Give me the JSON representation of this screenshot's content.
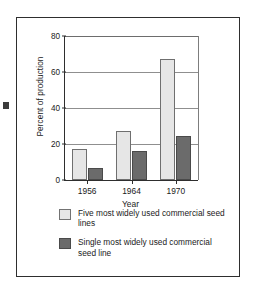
{
  "chart_data": {
    "type": "bar",
    "title": "",
    "xlabel": "Year",
    "ylabel": "Percent of production",
    "categories": [
      "1956",
      "1964",
      "1970"
    ],
    "ylim": [
      0,
      80
    ],
    "yticks": [
      0,
      20,
      40,
      60,
      80
    ],
    "ytick_labels": [
      "0",
      "20",
      "40",
      "60",
      "80"
    ],
    "grid": "horizontal",
    "legend_position": "below-axes",
    "series": [
      {
        "name": "Five most widely used commercial seed lines",
        "values": [
          17.5,
          27.5,
          67
        ],
        "color": "#e6e6e6"
      },
      {
        "name": "Single most widely used commercial seed line",
        "values": [
          6.5,
          16,
          24.5
        ],
        "color": "#6b6b6b"
      }
    ]
  },
  "legend": {
    "items": [
      {
        "label": "Five most widely used commercial seed lines",
        "swatch": "light-gray-swatch"
      },
      {
        "label": "Single most widely used commercial seed line",
        "swatch": "dark-gray-swatch"
      }
    ]
  }
}
